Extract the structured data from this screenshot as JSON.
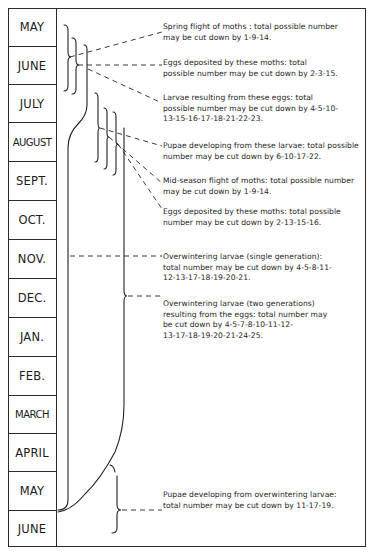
{
  "months": [
    {
      "label": "MAY"
    },
    {
      "label": "JUNE"
    },
    {
      "label": "JULY"
    },
    {
      "label": "AUGUST"
    },
    {
      "label": "SEPT."
    },
    {
      "label": "OCT."
    },
    {
      "label": "NOV."
    },
    {
      "label": "DEC."
    },
    {
      "label": "JAN."
    },
    {
      "label": "FEB."
    },
    {
      "label": "MARCH"
    },
    {
      "label": "APRIL"
    },
    {
      "label": "MAY"
    },
    {
      "label": "JUNE"
    }
  ],
  "stages": [
    {
      "id": "spring-flight",
      "lines": [
        "Spring flight of moths : total possible number",
        "may be cut down by 1-9-14."
      ]
    },
    {
      "id": "eggs-spring",
      "lines": [
        "Eggs deposited by these moths: total",
        "possible number may be cut down by 2-3-15."
      ]
    },
    {
      "id": "larvae-first",
      "lines": [
        "Larvae resulting from these eggs: total",
        "possible number may be cut down by 4-5-10-",
        "13-15-16-17-18-21-22-23."
      ]
    },
    {
      "id": "pupae-summer",
      "lines": [
        "Pupae developing from these larvae: total possible",
        "number may be cut down by 6-10-17-22."
      ]
    },
    {
      "id": "midseason-flight",
      "lines": [
        "Mid-season flight of moths: total possible number",
        "may be cut down by 1-9-14."
      ]
    },
    {
      "id": "eggs-midseason",
      "lines": [
        "Eggs deposited by these moths: total possible",
        "number may be cut down by 2-13-15-16."
      ]
    },
    {
      "id": "overwintering-single",
      "lines": [
        "Overwintering larvae (single generation):",
        "total number may be cut down by 4-5-8-11-",
        "12-13-17-18-19-20-21."
      ]
    },
    {
      "id": "overwintering-two",
      "lines": [
        "Overwintering larvae (two generations)",
        "resulting from the eggs: total number may",
        "be cut down by 4-5-7-8-10-11-12-",
        "13-17-18-19-20-21-24-25."
      ]
    },
    {
      "id": "pupae-overwintering",
      "lines": [
        "Pupae developing from overwintering larvae:",
        "total number may be cut down by 11-17-19."
      ]
    }
  ]
}
